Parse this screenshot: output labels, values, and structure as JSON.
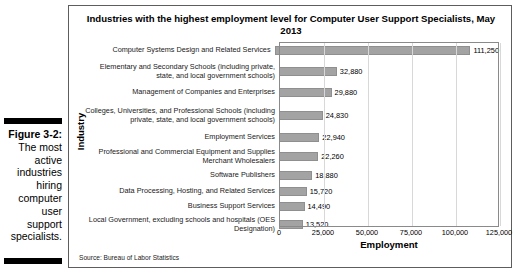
{
  "caption": {
    "figure_number": "Figure 3-2:",
    "body": "The most active industries hiring computer user support specialists."
  },
  "chart_panel": {
    "title": "Industries with the highest employment level for Computer User Support Specialists, May 2013",
    "source": "Source: Bureau of Labor Statistics"
  },
  "chart_data": {
    "type": "bar",
    "orientation": "horizontal",
    "title": "Industries with the highest employment level for Computer User Support Specialists, May 2013",
    "xlabel": "Employment",
    "ylabel": "Industry",
    "xlim": [
      0,
      125000
    ],
    "xticks": [
      0,
      25000,
      50000,
      75000,
      100000,
      125000
    ],
    "xticklabels": [
      "0",
      "25,000",
      "50,000",
      "75,000",
      "100,000",
      "125,000"
    ],
    "grid": true,
    "legend": false,
    "bar_color": "#a3a3a3",
    "categories": [
      "Computer Systems Design and Related Services",
      "Elementary and Secondary Schools (including private, state, and local government schools)",
      "Management of Companies and Enterprises",
      "Colleges, Universities, and Professional Schools (including private, state, and local government schools)",
      "Employment Services",
      "Professional and Commercial Equipment and Supplies Merchant Wholesalers",
      "Software Publishers",
      "Data Processing, Hosting, and Related Services",
      "Business Support Services",
      "Local Government, excluding schools and hospitals (OES Designation)"
    ],
    "values": [
      111250,
      32880,
      29880,
      24830,
      22940,
      22260,
      18880,
      15720,
      14490,
      13520
    ],
    "value_labels": [
      "111,250",
      "32,880",
      "29,880",
      "24,830",
      "22,940",
      "22,260",
      "18,880",
      "15,720",
      "14,490",
      "13,520"
    ],
    "row_heights_px": [
      17,
      25,
      17,
      29,
      15,
      23,
      15,
      16,
      15,
      21
    ]
  }
}
